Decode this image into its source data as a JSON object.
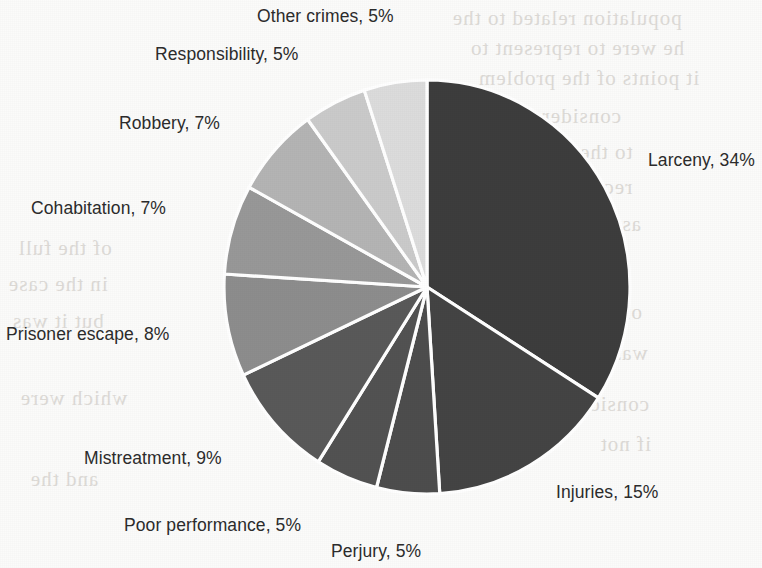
{
  "chart_data": {
    "type": "pie",
    "title": "",
    "subtitle": "",
    "xlabel": "",
    "ylabel": "",
    "legend_position": "none",
    "grid": false,
    "label_format": "{name}, {value}%",
    "start_angle_deg": 0,
    "direction": "clockwise",
    "categories": [
      "Larceny",
      "Injuries",
      "Perjury",
      "Poor performance",
      "Mistreatment",
      "Prisoner escape",
      "Cohabitation",
      "Robbery",
      "Responsibility",
      "Other crimes"
    ],
    "values": [
      34,
      15,
      5,
      5,
      9,
      8,
      7,
      7,
      5,
      5
    ],
    "unit": "%",
    "total": 100,
    "slices": [
      {
        "name": "Larceny",
        "value": 34,
        "label": "Larceny, 34%",
        "color": "#3d3d3d",
        "label_x": 648,
        "label_y": 150
      },
      {
        "name": "Injuries",
        "value": 15,
        "label": "Injuries, 15%",
        "color": "#444444",
        "label_x": 556,
        "label_y": 482
      },
      {
        "name": "Perjury",
        "value": 5,
        "label": "Perjury, 5%",
        "color": "#4d4d4d",
        "label_x": 331,
        "label_y": 541
      },
      {
        "name": "Poor performance",
        "value": 5,
        "label": "Poor performance, 5%",
        "color": "#525252",
        "label_x": 124,
        "label_y": 515
      },
      {
        "name": "Mistreatment",
        "value": 9,
        "label": "Mistreatment, 9%",
        "color": "#595959",
        "label_x": 84,
        "label_y": 448
      },
      {
        "name": "Prisoner escape",
        "value": 8,
        "label": "Prisoner escape, 8%",
        "color": "#8d8d8d",
        "label_x": 6,
        "label_y": 324
      },
      {
        "name": "Cohabitation",
        "value": 7,
        "label": "Cohabitation, 7%",
        "color": "#989898",
        "label_x": 31,
        "label_y": 198
      },
      {
        "name": "Robbery",
        "value": 7,
        "label": "Robbery, 7%",
        "color": "#b4b4b4",
        "label_x": 119,
        "label_y": 113
      },
      {
        "name": "Responsibility",
        "value": 5,
        "label": "Responsibility, 5%",
        "color": "#cacaca",
        "label_x": 155,
        "label_y": 44
      },
      {
        "name": "Other crimes",
        "value": 5,
        "label": "Other crimes, 5%",
        "color": "#dcdcdc",
        "label_x": 257,
        "label_y": 6
      }
    ]
  },
  "geometry": {
    "center_x": 427,
    "center_y": 287,
    "radius_x": 203,
    "radius_y": 207,
    "separator_color": "#ffffff",
    "separator_width": 3.2
  },
  "background": {
    "paper_color": "#fbfbfa",
    "ghost_text_color": "#d9d6d2",
    "ghost_lines": [
      {
        "text": "population related to the",
        "x": 452,
        "y": 6
      },
      {
        "text": "he were to represent to",
        "x": 470,
        "y": 36
      },
      {
        "text": "it points of the problem",
        "x": 478,
        "y": 66
      },
      {
        "text": "considered",
        "x": 520,
        "y": 104
      },
      {
        "text": "to the contrary",
        "x": 495,
        "y": 140
      },
      {
        "text": "recognized",
        "x": 530,
        "y": 175
      },
      {
        "text": "as the total",
        "x": 538,
        "y": 212
      },
      {
        "text": "of the full",
        "x": 18,
        "y": 236
      },
      {
        "text": "in the case",
        "x": 8,
        "y": 272
      },
      {
        "text": "but it was",
        "x": 12,
        "y": 309
      },
      {
        "text": "of which",
        "x": 560,
        "y": 300
      },
      {
        "text": "was not",
        "x": 576,
        "y": 341
      },
      {
        "text": "which were",
        "x": 20,
        "y": 386
      },
      {
        "text": "considered",
        "x": 548,
        "y": 392
      },
      {
        "text": "if not",
        "x": 600,
        "y": 432
      },
      {
        "text": "and the",
        "x": 30,
        "y": 467
      }
    ]
  }
}
